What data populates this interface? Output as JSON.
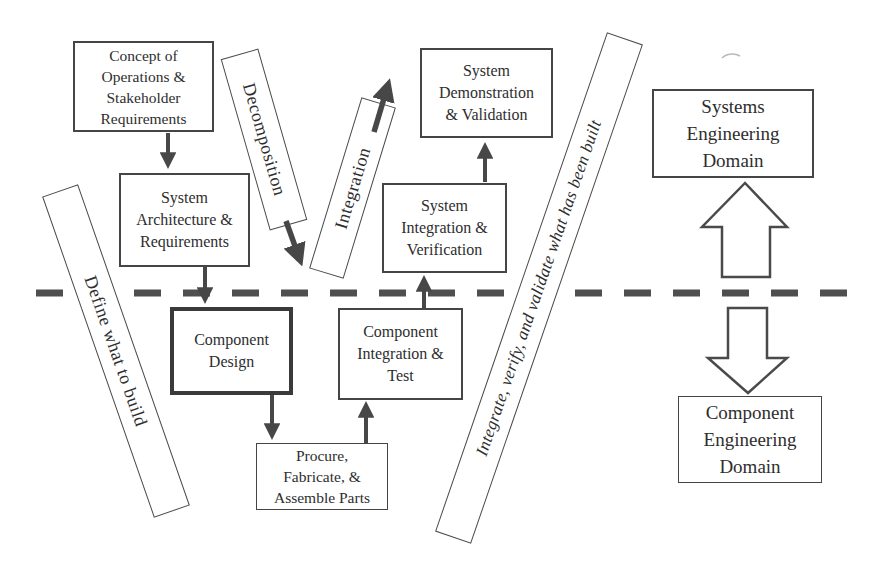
{
  "diagram": {
    "boxes": {
      "concept": {
        "label": "Concept of\nOperations &\nStakeholder\nRequirements"
      },
      "architecture": {
        "label": "System\nArchitecture &\nRequirements"
      },
      "demonstration": {
        "label": "System\nDemonstration\n& Validation"
      },
      "system_integration": {
        "label": "System\nIntegration &\nVerification"
      },
      "component_design": {
        "label": "Component\nDesign"
      },
      "component_integration": {
        "label": "Component\nIntegration &\nTest"
      },
      "procure": {
        "label": "Procure,\nFabricate, &\nAssemble Parts"
      }
    },
    "domains": {
      "systems": {
        "label": "Systems\nEngineering\nDomain"
      },
      "component": {
        "label": "Component\nEngineering\nDomain"
      }
    },
    "ribbons": {
      "decomposition": {
        "label": "Decomposition"
      },
      "integration": {
        "label": "Integration"
      },
      "define": {
        "label": "Define what to build"
      },
      "integrate_long": {
        "label": "Integrate, verify, and validate what has been built"
      }
    },
    "colors": {
      "ink": "#2e2e2e",
      "border": "#454545",
      "arrow": "#474747",
      "boundary_dash": "#4f4f4f",
      "background": "#ffffff"
    }
  }
}
